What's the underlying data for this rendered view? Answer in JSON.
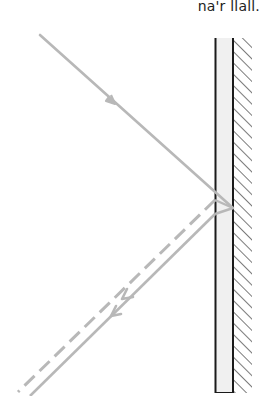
{
  "caption": "na'r llall.",
  "colors": {
    "ray": "#b8b8b8",
    "wall_outline": "#1a1a1a",
    "wall_fill": "#f0f0f0",
    "hatch": "#333333"
  },
  "diagram": {
    "type": "reflection-from-double-surface",
    "elements": [
      {
        "name": "incident-ray",
        "style": "solid",
        "direction": "toward wall"
      },
      {
        "name": "reflected-ray-front-surface",
        "style": "dashed",
        "direction": "away from wall"
      },
      {
        "name": "reflected-ray-back-surface",
        "style": "solid",
        "direction": "away from wall"
      },
      {
        "name": "glass-pane",
        "style": "outlined"
      },
      {
        "name": "hatched-backing",
        "style": "hatched"
      }
    ]
  }
}
